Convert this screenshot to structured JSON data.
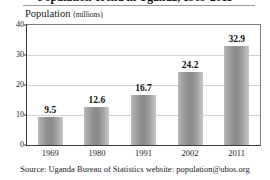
{
  "chart_data": {
    "type": "bar",
    "title": "Population Trend in Uganda, 1969-2011",
    "subtitle_main": "Population",
    "subtitle_unit": "(millions)",
    "categories": [
      "1969",
      "1980",
      "1991",
      "2002",
      "2011"
    ],
    "values": [
      9.5,
      12.6,
      16.7,
      24.2,
      32.9
    ],
    "value_labels": [
      "9.5",
      "12.6",
      "16.7",
      "24.2",
      "32.9"
    ],
    "xlabel": "",
    "ylabel": "Population (millions)",
    "ylim": [
      0,
      40
    ],
    "yticks": [
      0,
      10,
      20,
      30,
      40
    ],
    "ytick_labels": [
      "0",
      "10",
      "20",
      "30",
      "40"
    ],
    "grid": true,
    "legend": false,
    "bar_color": "#9a9a9a",
    "gridline_color": "#d2d2d2",
    "axis_color": "#3a3a3a",
    "source": "Source: Uganda Bureau of Statistics website: population@ubos.org"
  }
}
